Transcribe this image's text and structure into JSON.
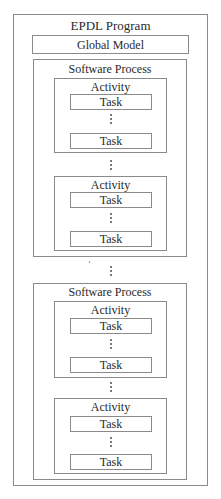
{
  "diagram": {
    "title": "EPDL Program",
    "global_model": "Global Model",
    "software_processes": [
      {
        "label": "Software Process",
        "activities": [
          {
            "label": "Activity",
            "tasks": [
              "Task",
              "Task"
            ]
          },
          {
            "label": "Activity",
            "tasks": [
              "Task",
              "Task"
            ]
          }
        ]
      },
      {
        "label": "Software Process",
        "activities": [
          {
            "label": "Activity",
            "tasks": [
              "Task",
              "Task"
            ]
          },
          {
            "label": "Activity",
            "tasks": [
              "Task",
              "Task"
            ]
          }
        ]
      }
    ],
    "ellipsis_symbol": "⋮",
    "colors": {
      "border": "#8a8a8a",
      "text": "#2a2a2a",
      "background": "#ffffff"
    }
  }
}
